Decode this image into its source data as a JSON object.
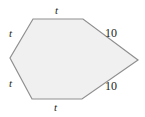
{
  "figure": {
    "type": "polygon-diagram",
    "shape_name": "hexagon",
    "fill_color": "#f0f0f0",
    "stroke_color": "#8f8f8f",
    "label_color": "#231f20",
    "background_color": "#ffffff",
    "vertices": [
      {
        "name": "top-left",
        "x": 33,
        "y": 19
      },
      {
        "name": "top-right",
        "x": 83,
        "y": 19
      },
      {
        "name": "right-tip",
        "x": 138,
        "y": 60
      },
      {
        "name": "bottom-right",
        "x": 82,
        "y": 99
      },
      {
        "name": "bottom-left",
        "x": 32,
        "y": 99
      },
      {
        "name": "left-vertex",
        "x": 10,
        "y": 58
      }
    ],
    "edges": [
      {
        "name": "top",
        "label": "t",
        "style": "italic"
      },
      {
        "name": "upper-right",
        "label": "10",
        "style": "normal"
      },
      {
        "name": "lower-right",
        "label": "10",
        "style": "normal"
      },
      {
        "name": "bottom",
        "label": "t",
        "style": "italic"
      },
      {
        "name": "lower-left",
        "label": "t",
        "style": "italic"
      },
      {
        "name": "upper-left",
        "label": "t",
        "style": "italic"
      }
    ],
    "labels": {
      "top_t": "t",
      "upper_left_t": "t",
      "lower_left_t": "t",
      "bottom_t": "t",
      "upper_right_10": "10",
      "lower_right_10": "10"
    }
  }
}
